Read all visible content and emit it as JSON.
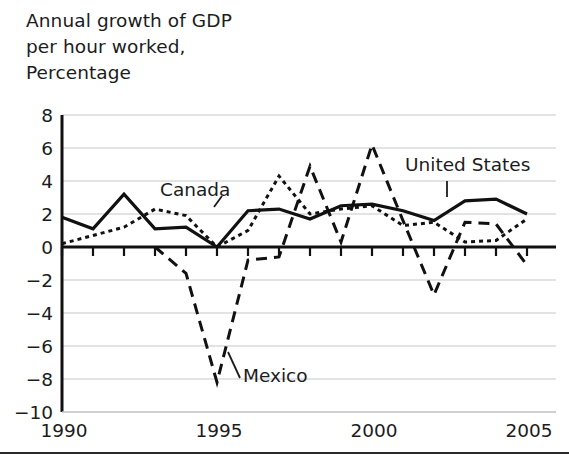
{
  "title": "Annual growth of GDP\nper hour worked,\nPercentage",
  "title_lines": [
    "Annual growth of GDP",
    "per hour worked,",
    "Percentage"
  ],
  "axes": {
    "y_label": "",
    "x_label": "",
    "y_ticks": [
      "8",
      "6",
      "4",
      "2",
      "0",
      "−2",
      "−4",
      "−6",
      "−8",
      "−10"
    ],
    "y_tick_values": [
      8,
      6,
      4,
      2,
      0,
      -2,
      -4,
      -6,
      -8,
      -10
    ],
    "x_ticks": [
      "1990",
      "1995",
      "2000",
      "2005"
    ],
    "x_tick_values": [
      1990,
      1995,
      2000,
      2005
    ],
    "ylim": [
      -10,
      8
    ],
    "xlim": [
      1990,
      2005
    ],
    "grid": "horizontal"
  },
  "annotations": [
    {
      "name": "canada-label",
      "text": "Canada",
      "x": 160,
      "y": 196
    },
    {
      "name": "mexico-label",
      "text": "Mexico",
      "x": 243,
      "y": 382
    },
    {
      "name": "united-states-label",
      "text": "United States",
      "x": 405,
      "y": 171
    }
  ],
  "chart_data": {
    "type": "line",
    "title": "Annual growth of GDP per hour worked, Percentage",
    "xlabel": "",
    "ylabel": "Percentage",
    "xlim": [
      1990,
      2005
    ],
    "ylim": [
      -10,
      8
    ],
    "grid": true,
    "legend": "inline-annotations",
    "x": [
      1990,
      1991,
      1992,
      1993,
      1994,
      1995,
      1996,
      1997,
      1998,
      1999,
      2000,
      2001,
      2002,
      2003,
      2004,
      2005
    ],
    "series": [
      {
        "name": "United States",
        "style": "solid",
        "color": "#111111",
        "x": [
          1990,
          1991,
          1992,
          1993,
          1994,
          1995,
          1996,
          1997,
          1998,
          1999,
          2000,
          2001,
          2002,
          2003,
          2004,
          2005
        ],
        "values": [
          1.8,
          1.1,
          3.2,
          1.1,
          1.2,
          0.0,
          2.2,
          2.3,
          1.7,
          2.5,
          2.6,
          2.2,
          1.6,
          2.8,
          2.9,
          2.0
        ]
      },
      {
        "name": "Canada",
        "style": "dotted",
        "color": "#111111",
        "x": [
          1990,
          1991,
          1992,
          1993,
          1994,
          1995,
          1996,
          1997,
          1998,
          1999,
          2000,
          2001,
          2002,
          2003,
          2004,
          2005
        ],
        "values": [
          0.2,
          0.7,
          1.2,
          2.3,
          1.9,
          0.0,
          1.0,
          4.3,
          2.0,
          2.3,
          2.5,
          1.3,
          1.5,
          0.3,
          0.4,
          1.7
        ]
      },
      {
        "name": "Mexico",
        "style": "dashed",
        "color": "#111111",
        "x": [
          1993,
          1994,
          1995,
          1996,
          1997,
          1998,
          1999,
          2000,
          2001,
          2002,
          2003,
          2004,
          2005
        ],
        "values": [
          0.0,
          -1.6,
          -8.2,
          -0.8,
          -0.6,
          4.9,
          0.3,
          6.2,
          1.6,
          -2.9,
          1.5,
          1.4,
          -1.1
        ]
      }
    ],
    "notable_points": {
      "mexico_trough_1995": -8.2,
      "mexico_peak_2000": 6.2,
      "canada_peak_1997": 4.3,
      "us_peak_2004": 2.9
    }
  },
  "geometry": {
    "plot_left": 62,
    "plot_right": 556,
    "plot_top": 115,
    "plot_bottom": 412,
    "x_per_year": 31.0,
    "y_zero": 247.0,
    "y_per_unit": 16.5
  }
}
